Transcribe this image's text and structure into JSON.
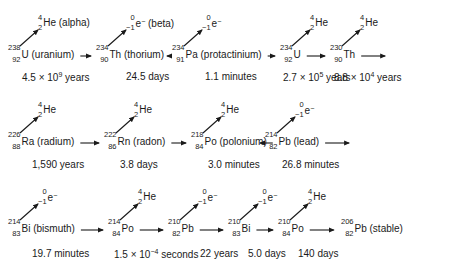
{
  "diagram": {
    "emissions": {
      "alpha": {
        "mass": "4",
        "charge": "2",
        "symbol": "He",
        "label": "(alpha)"
      },
      "beta": {
        "mass": "0",
        "charge": "−1",
        "symbol": "e",
        "sign": "−",
        "label": "(beta)"
      }
    },
    "rows": [
      [
        {
          "mass": "238",
          "z": "92",
          "symbol": "U",
          "name": "(uranium)",
          "half_life": "4.5 × 10",
          "half_life_exp": "9",
          "half_life_unit": " years",
          "emission": "alpha",
          "emission_label": "(alpha)"
        },
        {
          "mass": "234",
          "z": "90",
          "symbol": "Th",
          "name": "(thorium)",
          "half_life": "24.5 days",
          "half_life_exp": "",
          "half_life_unit": "",
          "emission": "beta",
          "emission_label": "(beta)"
        },
        {
          "mass": "234",
          "z": "91",
          "symbol": "Pa",
          "name": "(protactinium)",
          "half_life": "1.1 minutes",
          "half_life_exp": "",
          "half_life_unit": "",
          "emission": "beta",
          "emission_label": ""
        },
        {
          "mass": "234",
          "z": "92",
          "symbol": "U",
          "name": "",
          "half_life": "2.7 × 10",
          "half_life_exp": "5",
          "half_life_unit": " years",
          "emission": "alpha",
          "emission_label": ""
        },
        {
          "mass": "230",
          "z": "90",
          "symbol": "Th",
          "name": "",
          "half_life": "8.8 × 10",
          "half_life_exp": "4",
          "half_life_unit": " years",
          "emission": "alpha",
          "emission_label": ""
        }
      ],
      [
        {
          "mass": "226",
          "z": "88",
          "symbol": "Ra",
          "name": "(radium)",
          "half_life": "1,590 years",
          "half_life_exp": "",
          "half_life_unit": "",
          "emission": "alpha",
          "emission_label": ""
        },
        {
          "mass": "222",
          "z": "86",
          "symbol": "Rn",
          "name": "(radon)",
          "half_life": "3.8 days",
          "half_life_exp": "",
          "half_life_unit": "",
          "emission": "alpha",
          "emission_label": ""
        },
        {
          "mass": "218",
          "z": "84",
          "symbol": "Po",
          "name": "(polonium)",
          "half_life": "3.0 minutes",
          "half_life_exp": "",
          "half_life_unit": "",
          "emission": "alpha",
          "emission_label": ""
        },
        {
          "mass": "214",
          "z": "82",
          "symbol": "Pb",
          "name": "(lead)",
          "half_life": "26.8 minutes",
          "half_life_exp": "",
          "half_life_unit": "",
          "emission": "beta",
          "emission_label": ""
        }
      ],
      [
        {
          "mass": "214",
          "z": "83",
          "symbol": "Bi",
          "name": "(bismuth)",
          "half_life": "19.7 minutes",
          "half_life_exp": "",
          "half_life_unit": "",
          "emission": "beta",
          "emission_label": ""
        },
        {
          "mass": "214",
          "z": "84",
          "symbol": "Po",
          "name": "",
          "half_life": "1.5 × 10",
          "half_life_exp": "−4",
          "half_life_unit": " seconds",
          "emission": "alpha",
          "emission_label": ""
        },
        {
          "mass": "210",
          "z": "82",
          "symbol": "Pb",
          "name": "",
          "half_life": "22 years",
          "half_life_exp": "",
          "half_life_unit": "",
          "emission": "beta",
          "emission_label": ""
        },
        {
          "mass": "210",
          "z": "83",
          "symbol": "Bi",
          "name": "",
          "half_life": "5.0 days",
          "half_life_exp": "",
          "half_life_unit": "",
          "emission": "beta",
          "emission_label": ""
        },
        {
          "mass": "210",
          "z": "84",
          "symbol": "Po",
          "name": "",
          "half_life": "140 days",
          "half_life_exp": "",
          "half_life_unit": "",
          "emission": "alpha",
          "emission_label": ""
        },
        {
          "mass": "206",
          "z": "82",
          "symbol": "Pb",
          "name": "(stable)",
          "half_life": "",
          "half_life_exp": "",
          "half_life_unit": "",
          "emission": "",
          "emission_label": ""
        }
      ]
    ]
  }
}
